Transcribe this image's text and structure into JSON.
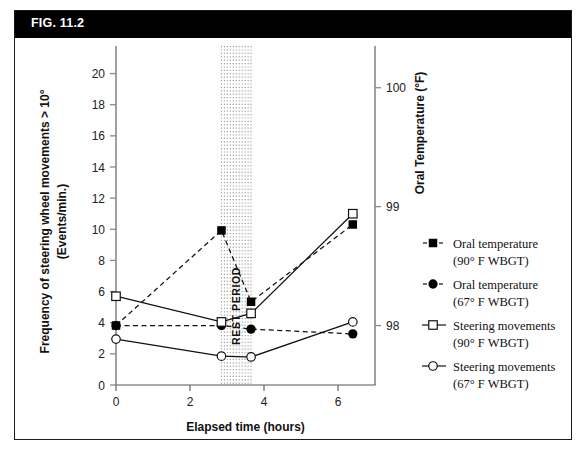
{
  "figure": {
    "title": "FIG. 11.2"
  },
  "chart_data": {
    "type": "line",
    "title": "FIG. 11.2",
    "xlabel": "Elapsed time (hours)",
    "ylabel": "Frequency of steering wheel movements > 10°",
    "ylabel_line2": "(Events/min.)",
    "y2label": "Oral Temperature (°F)",
    "xlim": [
      0,
      7
    ],
    "ylim": [
      0,
      21
    ],
    "y2lim": [
      97.5,
      100.25
    ],
    "xticks": [
      0,
      2,
      4,
      6
    ],
    "xticklabels": [
      "0",
      "2",
      "4",
      "6"
    ],
    "yticks": [
      0,
      2,
      4,
      6,
      8,
      10,
      12,
      14,
      16,
      18,
      20
    ],
    "yticklabels": [
      "0",
      "2",
      "4",
      "6",
      "8",
      "10",
      "12",
      "14",
      "16",
      "18",
      "20"
    ],
    "y2ticks": [
      98,
      99,
      100
    ],
    "y2ticklabels": [
      "98",
      "99",
      "100"
    ],
    "grid": false,
    "legend_position": "right",
    "annotation": {
      "label": "REST PERIOD",
      "x_start": 2.85,
      "x_end": 3.65
    },
    "series": [
      {
        "name": "Oral temperature (90° F  WBGT)",
        "name_line1": "Oral temperature",
        "name_line2": "(90° F  WBGT)",
        "marker": "filled-square",
        "linestyle": "dashed",
        "axis": "right",
        "x": [
          0,
          2.85,
          3.65,
          6.4
        ],
        "y": [
          98.0,
          98.8,
          98.2,
          98.85
        ]
      },
      {
        "name": "Oral temperature (67° F WBGT)",
        "name_line1": "Oral temperature",
        "name_line2": "(67° F WBGT)",
        "marker": "filled-circle",
        "linestyle": "dashed",
        "axis": "right",
        "x": [
          0,
          2.85,
          3.65,
          6.4
        ],
        "y": [
          98.0,
          98.0,
          97.97,
          97.93
        ]
      },
      {
        "name": "Steering movements (90° F  WBGT)",
        "name_line1": "Steering movements",
        "name_line2": "(90° F  WBGT)",
        "marker": "open-square",
        "linestyle": "solid",
        "axis": "left",
        "x": [
          0,
          2.85,
          3.65,
          6.4
        ],
        "y": [
          5.7,
          4.05,
          4.6,
          11.0
        ]
      },
      {
        "name": "Steering movements (67° F WBGT)",
        "name_line1": "Steering movements",
        "name_line2": "(67° F WBGT)",
        "marker": "open-circle",
        "linestyle": "solid",
        "axis": "left",
        "x": [
          0,
          2.85,
          3.65,
          6.4
        ],
        "y": [
          2.95,
          1.85,
          1.8,
          4.05
        ]
      }
    ]
  },
  "colors": {
    "ink": "#111111",
    "axis": "#888888",
    "titlebar_bg": "#000000",
    "titlebar_fg": "#ffffff",
    "band": "#9a9a9a"
  }
}
